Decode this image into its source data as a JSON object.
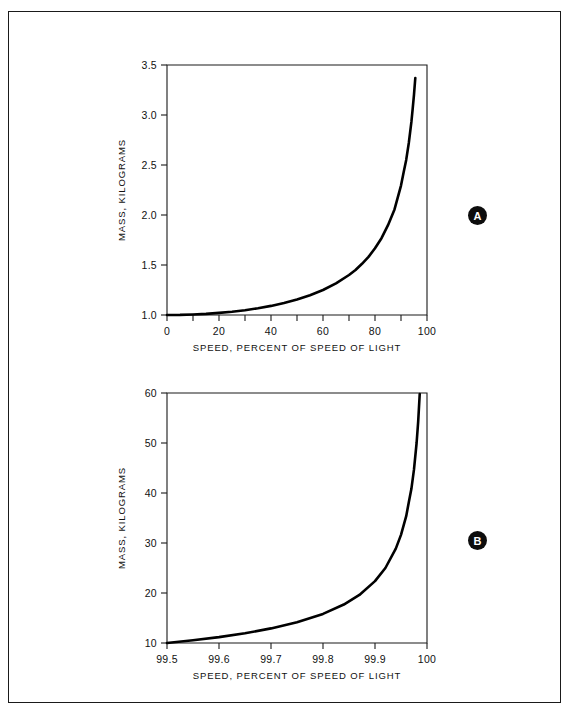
{
  "figure": {
    "panels": [
      {
        "id": "A",
        "marker_label": "A",
        "xlabel": "SPEED, PERCENT OF SPEED OF LIGHT",
        "ylabel": "MASS, KILOGRAMS",
        "xticks": [
          "0",
          "20",
          "40",
          "60",
          "80",
          "100"
        ],
        "yticks": [
          "1.0",
          "1.5",
          "2.0",
          "2.5",
          "3.0",
          "3.5"
        ]
      },
      {
        "id": "B",
        "marker_label": "B",
        "xlabel": "SPEED, PERCENT OF SPEED OF LIGHT",
        "ylabel": "MASS, KILOGRAMS",
        "xticks": [
          "99.5",
          "99.6",
          "99.7",
          "99.8",
          "99.9",
          "100"
        ],
        "yticks": [
          "10",
          "20",
          "30",
          "40",
          "50",
          "60"
        ]
      }
    ]
  },
  "chart_data": [
    {
      "type": "line",
      "panel": "A",
      "title": "",
      "xlabel": "SPEED, PERCENT OF SPEED OF LIGHT",
      "ylabel": "MASS, KILOGRAMS",
      "xlim": [
        0,
        100
      ],
      "ylim": [
        1.0,
        3.5
      ],
      "xticks": [
        0,
        10,
        20,
        30,
        40,
        50,
        60,
        70,
        80,
        90,
        100
      ],
      "xtick_labels": [
        "0",
        "",
        "20",
        "",
        "40",
        "",
        "60",
        "",
        "80",
        "",
        "100"
      ],
      "yticks": [
        1.0,
        1.5,
        2.0,
        2.5,
        3.0,
        3.5
      ],
      "ytick_labels": [
        "1.0",
        "1.5",
        "2.0",
        "2.5",
        "3.0",
        "3.5"
      ],
      "grid": false,
      "legend": "none",
      "series": [
        {
          "name": "relativistic mass",
          "x": [
            0,
            5,
            10,
            15,
            20,
            25,
            30,
            35,
            40,
            45,
            50,
            55,
            60,
            65,
            70,
            72.5,
            75,
            77.5,
            80,
            82.5,
            85,
            87.5,
            90,
            91,
            92,
            93,
            94,
            94.5,
            95,
            95.5
          ],
          "y": [
            1.0,
            1.001,
            1.005,
            1.011,
            1.021,
            1.033,
            1.048,
            1.068,
            1.091,
            1.119,
            1.155,
            1.198,
            1.25,
            1.316,
            1.4,
            1.45,
            1.512,
            1.581,
            1.667,
            1.768,
            1.898,
            2.056,
            2.294,
            2.426,
            2.551,
            2.72,
            2.931,
            3.064,
            3.203,
            3.37
          ]
        }
      ]
    },
    {
      "type": "line",
      "panel": "B",
      "title": "",
      "xlabel": "SPEED, PERCENT OF SPEED OF LIGHT",
      "ylabel": "MASS, KILOGRAMS",
      "xlim": [
        99.5,
        100
      ],
      "ylim": [
        10,
        60
      ],
      "xticks": [
        99.5,
        99.6,
        99.7,
        99.8,
        99.9,
        100
      ],
      "xtick_labels": [
        "99.5",
        "99.6",
        "99.7",
        "99.8",
        "99.9",
        "100"
      ],
      "yticks": [
        10,
        20,
        30,
        40,
        50,
        60
      ],
      "ytick_labels": [
        "10",
        "20",
        "30",
        "40",
        "50",
        "60"
      ],
      "grid": false,
      "legend": "none",
      "series": [
        {
          "name": "relativistic mass",
          "x": [
            99.5,
            99.55,
            99.6,
            99.65,
            99.7,
            99.75,
            99.8,
            99.84,
            99.87,
            99.9,
            99.92,
            99.94,
            99.95,
            99.96,
            99.965,
            99.97,
            99.975,
            99.98,
            99.983,
            99.986
          ],
          "y": [
            10.01,
            10.54,
            11.18,
            11.95,
            12.92,
            14.15,
            15.82,
            17.69,
            19.61,
            22.37,
            25.0,
            28.87,
            31.63,
            35.36,
            38.15,
            40.83,
            44.72,
            50.0,
            54.23,
            59.8
          ]
        }
      ]
    }
  ]
}
